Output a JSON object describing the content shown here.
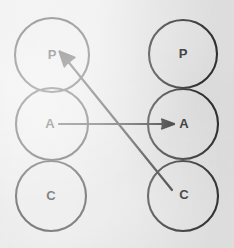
{
  "figure": {
    "name": "two-column-circle-node-diagram",
    "background_color": "#e9e9e9",
    "stroke_color": "#333333",
    "label_color": "#2b2b2b",
    "width": 234,
    "height": 248
  },
  "columns": [
    {
      "name": "left-column",
      "nodes": [
        {
          "label": "P",
          "cx": 52,
          "cy": 55,
          "r": 37
        },
        {
          "label": "A",
          "cx": 52,
          "cy": 124,
          "r": 36
        },
        {
          "label": "C",
          "cx": 51,
          "cy": 196,
          "r": 35
        }
      ]
    },
    {
      "name": "right-column",
      "nodes": [
        {
          "label": "P",
          "cx": 183,
          "cy": 54,
          "r": 34
        },
        {
          "label": "A",
          "cx": 183,
          "cy": 124,
          "r": 35
        },
        {
          "label": "C",
          "cx": 183,
          "cy": 196,
          "r": 35
        }
      ]
    }
  ],
  "edges": [
    {
      "name": "edge-left-a-to-right-a",
      "from": "left-A",
      "to": "right-A",
      "x1": 59,
      "y1": 124,
      "x2": 174,
      "y2": 124,
      "arrow_at": "end",
      "orientation": "horizontal"
    },
    {
      "name": "edge-right-c-to-left-p",
      "from": "right-C",
      "to": "left-P",
      "x1": 172,
      "y1": 190,
      "x2": 60,
      "y2": 52,
      "arrow_at": "end",
      "orientation": "diagonal"
    }
  ],
  "labels": {
    "left_p": "P",
    "left_a": "A",
    "left_c": "C",
    "right_p": "P",
    "right_a": "A",
    "right_c": "C"
  }
}
